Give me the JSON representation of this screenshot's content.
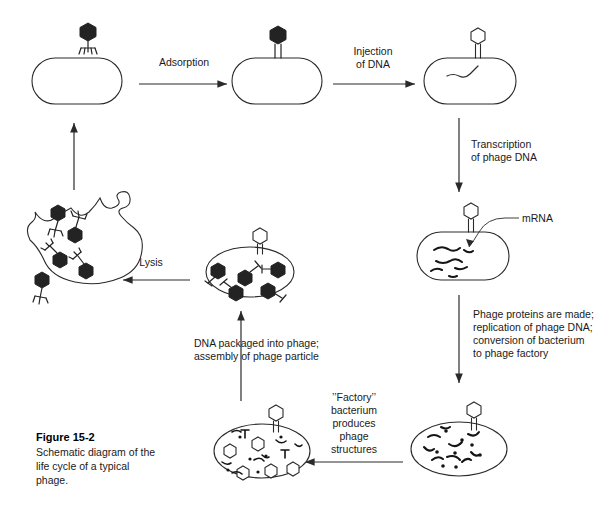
{
  "figure": {
    "number": "Figure 15-2",
    "caption_lines": [
      "Schematic diagram of the",
      "life cycle of a typical",
      "phage."
    ]
  },
  "steps": {
    "adsorption": {
      "lines": [
        "Adsorption"
      ]
    },
    "injection": {
      "lines": [
        "Injection",
        "of DNA"
      ]
    },
    "transcription": {
      "lines": [
        "Transcription",
        "of phage DNA"
      ]
    },
    "protein_synthesis": {
      "lines": [
        "Phage proteins are made;",
        "replication of phage DNA;",
        "conversion of bacterium",
        "to phage factory"
      ]
    },
    "factory": {
      "lines": [
        "’’Factory’’",
        "bacterium",
        "produces",
        "phage",
        "structures"
      ]
    },
    "packaging": {
      "lines": [
        "DNA packaged into phage;",
        "assembly of phage particle"
      ]
    },
    "lysis": {
      "lines": [
        "Lysis"
      ]
    }
  },
  "annotations": {
    "mrna": "mRNA"
  },
  "stages": {
    "free_phage": "free-phage",
    "bacterium_empty": "uninfected-bacterium",
    "bacterium_adsorbed": "phage-adsorbed-bacterium",
    "bacterium_injected": "dna-injected-bacterium",
    "bacterium_transcribing": "transcribing-bacterium",
    "bacterium_factory": "phage-factory-bacterium",
    "bacterium_assembled": "assembled-phage-bacterium",
    "bacterium_lysing": "lysing-bacterium"
  },
  "colors": {
    "ink": "#2a2a2a",
    "fill_dark": "#232323",
    "background": "#ffffff"
  }
}
